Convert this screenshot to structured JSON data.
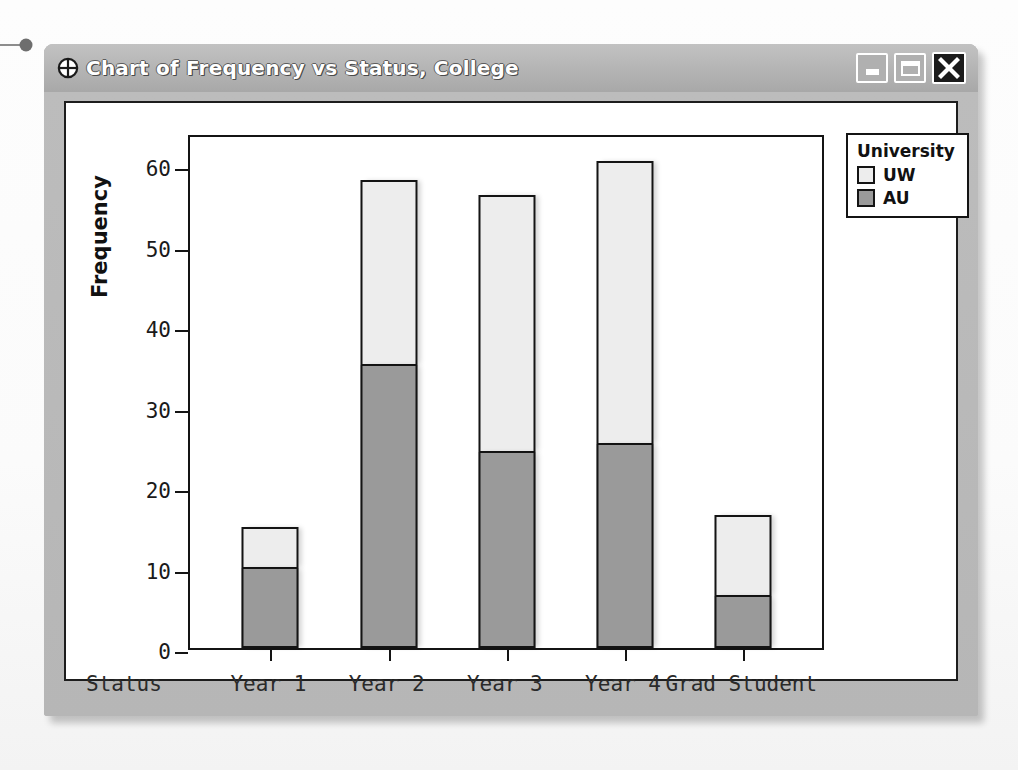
{
  "window": {
    "title": "Chart of Frequency vs Status, College",
    "icon": "crosshair-icon",
    "controls": {
      "minimize_label": "",
      "maximize_label": "",
      "close_label": "✕"
    }
  },
  "chart_data": {
    "type": "bar",
    "subtype": "stacked",
    "title": "Chart of Frequency vs Status, College",
    "xlabel": "Status",
    "ylabel": "Frequency",
    "categories": [
      "Year 1",
      "Year 2",
      "Year 3",
      "Year 4",
      "Grad Student"
    ],
    "series": [
      {
        "name": "AU",
        "values": [
          10.0,
          35.2,
          24.3,
          25.4,
          6.5
        ],
        "color": "#9a9a9a"
      },
      {
        "name": "UW",
        "values": [
          5.0,
          22.9,
          32.0,
          35.1,
          10.0
        ],
        "color": "#ededed"
      }
    ],
    "stack_order": [
      "AU",
      "UW"
    ],
    "totals": [
      15.0,
      58.1,
      56.3,
      60.5,
      16.5
    ],
    "ylim": [
      0,
      64
    ],
    "yticks": [
      0,
      10,
      20,
      30,
      40,
      50,
      60
    ],
    "ytick_labels": [
      "0",
      "10",
      "20",
      "30",
      "40",
      "50",
      "60"
    ],
    "grid": false,
    "legend": {
      "title": "University",
      "position": "right",
      "entries": [
        {
          "label": "UW",
          "color": "#ededed"
        },
        {
          "label": "AU",
          "color": "#9a9a9a"
        }
      ]
    }
  }
}
